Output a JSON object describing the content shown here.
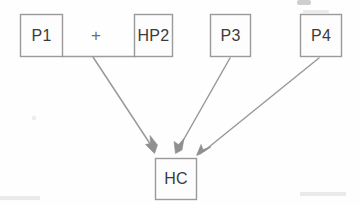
{
  "diagram": {
    "type": "flow-diagram",
    "background_color": "#fefefe",
    "line_color": "#9a9a9a",
    "text_color": "#3b3b3b",
    "nodes": [
      {
        "id": "p1",
        "label": "P1",
        "x": 20,
        "y": 14,
        "w": 43,
        "h": 42
      },
      {
        "id": "hp2",
        "label": "HP2",
        "x": 134,
        "y": 14,
        "w": 39,
        "h": 42
      },
      {
        "id": "p3",
        "label": "P3",
        "x": 210,
        "y": 14,
        "w": 41,
        "h": 42
      },
      {
        "id": "p4",
        "label": "P4",
        "x": 300,
        "y": 14,
        "w": 42,
        "h": 42
      },
      {
        "id": "hc",
        "label": "HC",
        "x": 155,
        "y": 158,
        "w": 42,
        "h": 42
      }
    ],
    "operators": [
      {
        "id": "plus",
        "label": "+",
        "x": 96,
        "y": 37
      }
    ],
    "connectors": [
      {
        "id": "p1-hp2-join",
        "kind": "line",
        "from": "p1",
        "to": "hp2",
        "x1": 62,
        "y1": 56,
        "x2": 135,
        "y2": 56
      }
    ],
    "arrows": [
      {
        "id": "arrow-p1hp2-hc",
        "kind": "arrow",
        "from": "p1-hp2-join",
        "to": "hc",
        "x1": 93,
        "y1": 57,
        "x2": 155,
        "y2": 152
      },
      {
        "id": "arrow-p3-hc",
        "kind": "arrow",
        "from": "p3",
        "to": "hc",
        "x1": 230,
        "y1": 58,
        "x2": 177,
        "y2": 152
      },
      {
        "id": "arrow-p4-hc",
        "kind": "arrow",
        "from": "p4",
        "to": "hc",
        "x1": 319,
        "y1": 58,
        "x2": 198,
        "y2": 155
      }
    ]
  }
}
